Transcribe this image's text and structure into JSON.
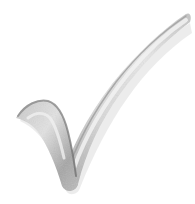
{
  "image": {
    "subject": "checkmark-icon",
    "description": "Grayscale 3D-shaded check mark",
    "colors": {
      "background": "#ffffff",
      "highlight": "#f4f4f4",
      "light": "#dcdcdc",
      "mid": "#b8b8b8",
      "dark": "#8c8c8c",
      "shadow": "#6e6e6e"
    }
  }
}
